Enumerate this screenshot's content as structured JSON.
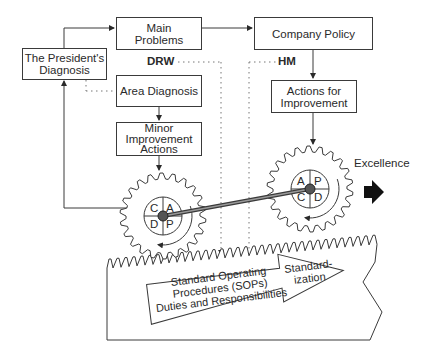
{
  "diagram": {
    "boxes": {
      "presidents_diagnosis": "The President's\nDiagnosis",
      "main_problems": "Main\nProblems",
      "company_policy": "Company Policy",
      "area_diagnosis": "Area Diagnosis",
      "minor_improvement_actions": "Minor\nImprovement\nActions",
      "actions_for_improvement": "Actions for\nImprovement"
    },
    "labels": {
      "drw": "DRW",
      "hm": "HM",
      "excellence": "Excellence"
    },
    "left_gear": {
      "quadrants": [
        "C",
        "A",
        "D",
        "P"
      ]
    },
    "right_gear": {
      "quadrants": [
        "A",
        "P",
        "C",
        "D"
      ]
    },
    "sop_arrow": {
      "line1": "Standard Operating",
      "line2": "Procedures (SOPs)",
      "line3": "Duties and Responsibilities",
      "head_line1": "Standard-",
      "head_line2": "ization"
    },
    "colors": {
      "stroke": "#3a3a3a",
      "text": "#2a2a2a",
      "arrow_fill": "#111111"
    }
  }
}
